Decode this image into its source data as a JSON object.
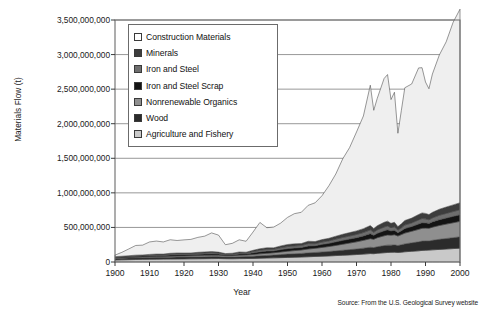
{
  "chart_data": {
    "type": "area",
    "title": "",
    "xlabel": "Year",
    "ylabel": "Materials Flow (t)",
    "xlim": [
      1900,
      2000
    ],
    "ylim": [
      0,
      3500000000
    ],
    "ytick_labels": [
      "3,500,000,000",
      "3,000,000,000",
      "2,500,000,000",
      "2,000,000,000",
      "1,500,000,000",
      "1,000,000,000",
      "500,000,000",
      "0"
    ],
    "ytick_values": [
      3500000000,
      3000000000,
      2500000000,
      2000000000,
      1500000000,
      1000000000,
      500000000,
      0
    ],
    "xtick_labels": [
      "1900",
      "1910",
      "1920",
      "1930",
      "1940",
      "1950",
      "1960",
      "1970",
      "1980",
      "1990",
      "2000"
    ],
    "xtick_values": [
      1900,
      1910,
      1920,
      1930,
      1940,
      1950,
      1960,
      1970,
      1980,
      1990,
      2000
    ],
    "grid": "horizontal",
    "legend_position": "top-left-inside",
    "stacked": true,
    "stack_order_bottom_to_top": [
      "Agriculture and Fishery",
      "Wood",
      "Nonrenewable Organics",
      "Iron and Steel Scrap",
      "Iron and Steel",
      "Minerals",
      "Construction Materials"
    ],
    "source_note": "Source: From the U.S. Geological Survey website",
    "x": [
      1900,
      1902,
      1904,
      1906,
      1908,
      1910,
      1912,
      1914,
      1916,
      1918,
      1920,
      1922,
      1924,
      1926,
      1928,
      1930,
      1932,
      1934,
      1936,
      1938,
      1940,
      1942,
      1944,
      1946,
      1948,
      1950,
      1952,
      1954,
      1956,
      1958,
      1960,
      1962,
      1964,
      1966,
      1968,
      1970,
      1972,
      1974,
      1975,
      1976,
      1978,
      1979,
      1980,
      1981,
      1982,
      1983,
      1984,
      1986,
      1988,
      1989,
      1990,
      1991,
      1992,
      1994,
      1996,
      1998,
      2000
    ],
    "series": [
      {
        "name": "Agriculture and Fishery",
        "color": "#c9c9c9",
        "values": [
          30000000,
          32000000,
          34000000,
          36000000,
          38000000,
          40000000,
          41000000,
          42000000,
          43000000,
          44000000,
          45000000,
          46000000,
          47000000,
          48000000,
          49000000,
          50000000,
          48000000,
          47000000,
          49000000,
          50000000,
          52000000,
          55000000,
          58000000,
          60000000,
          63000000,
          66000000,
          69000000,
          72000000,
          76000000,
          80000000,
          84000000,
          88000000,
          93000000,
          98000000,
          103000000,
          108000000,
          114000000,
          122000000,
          120000000,
          126000000,
          134000000,
          138000000,
          140000000,
          142000000,
          138000000,
          142000000,
          148000000,
          155000000,
          162000000,
          168000000,
          170000000,
          172000000,
          176000000,
          182000000,
          188000000,
          194000000,
          200000000
        ]
      },
      {
        "name": "Wood",
        "color": "#2b2b2b",
        "values": [
          22000000,
          23000000,
          24000000,
          25000000,
          25000000,
          26000000,
          26000000,
          26000000,
          27000000,
          27000000,
          27000000,
          28000000,
          28000000,
          29000000,
          29000000,
          28000000,
          25000000,
          26000000,
          28000000,
          29000000,
          32000000,
          35000000,
          37000000,
          40000000,
          44000000,
          48000000,
          50000000,
          52000000,
          56000000,
          58000000,
          61000000,
          64000000,
          68000000,
          72000000,
          76000000,
          80000000,
          86000000,
          92000000,
          88000000,
          95000000,
          103000000,
          106000000,
          104000000,
          106000000,
          100000000,
          108000000,
          114000000,
          122000000,
          130000000,
          134000000,
          134000000,
          132000000,
          138000000,
          146000000,
          152000000,
          158000000,
          164000000
        ]
      },
      {
        "name": "Nonrenewable Organics",
        "color": "#8f8f8f",
        "values": [
          6000000,
          7000000,
          8000000,
          9000000,
          10000000,
          11000000,
          12000000,
          13000000,
          14000000,
          15000000,
          16000000,
          17000000,
          18000000,
          19000000,
          20000000,
          20000000,
          18000000,
          19000000,
          21000000,
          22000000,
          25000000,
          28000000,
          31000000,
          34000000,
          38000000,
          42000000,
          46000000,
          50000000,
          56000000,
          60000000,
          66000000,
          72000000,
          79000000,
          87000000,
          95000000,
          104000000,
          113000000,
          124000000,
          120000000,
          130000000,
          142000000,
          147000000,
          144000000,
          146000000,
          138000000,
          146000000,
          156000000,
          168000000,
          180000000,
          186000000,
          186000000,
          184000000,
          190000000,
          200000000,
          208000000,
          216000000,
          224000000
        ]
      },
      {
        "name": "Iron and Steel Scrap",
        "color": "#141414",
        "values": [
          8000000,
          9000000,
          10000000,
          12000000,
          12000000,
          14000000,
          15000000,
          14000000,
          17000000,
          18000000,
          17000000,
          16000000,
          19000000,
          20000000,
          21000000,
          18000000,
          12000000,
          14000000,
          19000000,
          16000000,
          24000000,
          30000000,
          32000000,
          28000000,
          34000000,
          38000000,
          38000000,
          36000000,
          44000000,
          38000000,
          44000000,
          46000000,
          52000000,
          56000000,
          58000000,
          60000000,
          64000000,
          72000000,
          58000000,
          64000000,
          72000000,
          74000000,
          62000000,
          66000000,
          48000000,
          56000000,
          66000000,
          68000000,
          78000000,
          80000000,
          76000000,
          70000000,
          76000000,
          84000000,
          88000000,
          92000000,
          96000000
        ]
      },
      {
        "name": "Iron and Steel",
        "color": "#6e6e6e",
        "values": [
          6000000,
          7000000,
          8000000,
          9000000,
          9000000,
          10000000,
          11000000,
          10000000,
          13000000,
          14000000,
          13000000,
          12000000,
          14000000,
          15000000,
          16000000,
          13000000,
          9000000,
          10000000,
          14000000,
          12000000,
          18000000,
          22000000,
          24000000,
          21000000,
          26000000,
          29000000,
          29000000,
          27000000,
          33000000,
          28000000,
          33000000,
          35000000,
          39000000,
          42000000,
          44000000,
          46000000,
          49000000,
          55000000,
          44000000,
          49000000,
          55000000,
          56000000,
          47000000,
          50000000,
          36000000,
          42000000,
          50000000,
          52000000,
          59000000,
          61000000,
          58000000,
          53000000,
          58000000,
          64000000,
          67000000,
          70000000,
          73000000
        ]
      },
      {
        "name": "Minerals",
        "color": "#3d3d3d",
        "values": [
          5000000,
          6000000,
          7000000,
          8000000,
          8000000,
          9000000,
          10000000,
          10000000,
          12000000,
          13000000,
          12000000,
          12000000,
          14000000,
          15000000,
          16000000,
          14000000,
          10000000,
          11000000,
          14000000,
          13000000,
          18000000,
          22000000,
          24000000,
          22000000,
          27000000,
          30000000,
          31000000,
          30000000,
          35000000,
          32000000,
          36000000,
          38000000,
          42000000,
          46000000,
          49000000,
          52000000,
          56000000,
          62000000,
          54000000,
          60000000,
          68000000,
          70000000,
          62000000,
          65000000,
          52000000,
          58000000,
          66000000,
          70000000,
          78000000,
          81000000,
          79000000,
          75000000,
          80000000,
          87000000,
          92000000,
          96000000,
          100000000
        ]
      },
      {
        "name": "Construction Materials",
        "color": "#efefef",
        "values": [
          23000000,
          56000000,
          98000000,
          140000000,
          142000000,
          180000000,
          188000000,
          175000000,
          196000000,
          180000000,
          190000000,
          196000000,
          216000000,
          228000000,
          270000000,
          246000000,
          128000000,
          143000000,
          176000000,
          158000000,
          264000000,
          380000000,
          290000000,
          300000000,
          330000000,
          392000000,
          436000000,
          452000000,
          520000000,
          560000000,
          635000000,
          760000000,
          900000000,
          1090000000,
          1230000000,
          1430000000,
          1630000000,
          2030000000,
          1710000000,
          1840000000,
          2080000000,
          2120000000,
          1790000000,
          1880000000,
          1350000000,
          1640000000,
          1920000000,
          1940000000,
          2120000000,
          2100000000,
          1900000000,
          1820000000,
          2000000000,
          2230000000,
          2390000000,
          2640000000,
          2800000000
        ]
      }
    ]
  },
  "legend": {
    "items": [
      {
        "label": "Construction Materials",
        "swatch": "#ffffff"
      },
      {
        "label": "Minerals",
        "swatch": "#3d3d3d"
      },
      {
        "label": "Iron and Steel",
        "swatch": "#6e6e6e"
      },
      {
        "label": "Iron and Steel Scrap",
        "swatch": "#141414"
      },
      {
        "label": "Nonrenewable Organics",
        "swatch": "#8f8f8f"
      },
      {
        "label": "Wood",
        "swatch": "#2b2b2b"
      },
      {
        "label": "Agriculture and Fishery",
        "swatch": "#c9c9c9"
      }
    ]
  },
  "axis_title_y": "Materials Flow (t)",
  "axis_title_x": "Year",
  "source": "Source: From the U.S. Geological Survey website"
}
